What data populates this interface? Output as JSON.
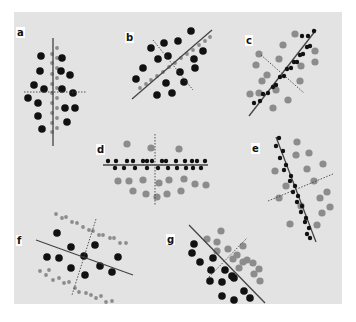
{
  "figure": {
    "background": "#e3e3e3",
    "colors": {
      "dark": "#111111",
      "gray": "#8c8c8c",
      "axis": "#444444"
    },
    "panels": [
      {
        "id": "a",
        "label": "a",
        "label_pos": [
          16,
          27
        ],
        "solid_axis": [
          [
            53,
            38
          ],
          [
            53,
            146
          ]
        ],
        "dashed_axis": [
          [
            24,
            92
          ],
          [
            86,
            92
          ]
        ],
        "dark_large": [
          [
            41,
            56
          ],
          [
            62,
            58
          ],
          [
            40,
            71
          ],
          [
            61,
            71
          ],
          [
            70,
            75
          ],
          [
            34,
            85
          ],
          [
            44,
            89
          ],
          [
            62,
            89
          ],
          [
            73,
            93
          ],
          [
            28,
            98
          ],
          [
            38,
            103
          ],
          [
            65,
            108
          ],
          [
            75,
            108
          ],
          [
            38,
            116
          ],
          [
            67,
            122
          ],
          [
            42,
            129
          ]
        ],
        "gray_small": [
          [
            57,
            48
          ],
          [
            52,
            54
          ],
          [
            57,
            58
          ],
          [
            52,
            63
          ],
          [
            57,
            68
          ],
          [
            52,
            74
          ],
          [
            57,
            78
          ],
          [
            52,
            84
          ],
          [
            57,
            88
          ],
          [
            52,
            93
          ],
          [
            57,
            98
          ],
          [
            52,
            103
          ],
          [
            57,
            108
          ],
          [
            52,
            113
          ],
          [
            57,
            118
          ],
          [
            52,
            123
          ],
          [
            57,
            128
          ],
          [
            52,
            132
          ]
        ]
      },
      {
        "id": "b",
        "label": "b",
        "label_pos": [
          125,
          32
        ],
        "solid_axis": [
          [
            132,
            99
          ],
          [
            212,
            30
          ]
        ],
        "dashed_axis": [
          [
            153,
            40
          ],
          [
            193,
            90
          ]
        ],
        "dark_large": [
          [
            191,
            31
          ],
          [
            151,
            48
          ],
          [
            164,
            43
          ],
          [
            178,
            41
          ],
          [
            203,
            51
          ],
          [
            158,
            59
          ],
          [
            168,
            56
          ],
          [
            194,
            59
          ],
          [
            143,
            68
          ],
          [
            180,
            72
          ],
          [
            195,
            68
          ],
          [
            136,
            79
          ],
          [
            166,
            83
          ],
          [
            184,
            82
          ],
          [
            157,
            95
          ],
          [
            172,
            93
          ]
        ],
        "gray_small": [
          [
            140,
            88
          ],
          [
            146,
            84
          ],
          [
            151,
            80
          ],
          [
            157,
            76
          ],
          [
            163,
            72
          ],
          [
            169,
            67
          ],
          [
            175,
            63
          ],
          [
            181,
            58
          ],
          [
            187,
            54
          ],
          [
            193,
            50
          ],
          [
            199,
            45
          ],
          [
            205,
            41
          ],
          [
            210,
            37
          ]
        ]
      },
      {
        "id": "c",
        "label": "c",
        "label_pos": [
          245,
          35
        ],
        "solid_axis": [
          [
            249,
            116
          ],
          [
            316,
            30
          ]
        ],
        "dashed_axis": [
          [
            261,
            55
          ],
          [
            304,
            93
          ]
        ],
        "dark_large": [],
        "gray_large": [
          [
            295,
            34
          ],
          [
            283,
            45
          ],
          [
            315,
            51
          ],
          [
            315,
            62
          ],
          [
            259,
            54
          ],
          [
            279,
            59
          ],
          [
            301,
            66
          ],
          [
            256,
            65
          ],
          [
            267,
            75
          ],
          [
            262,
            81
          ],
          [
            250,
            94
          ],
          [
            276,
            90
          ],
          [
            300,
            81
          ],
          [
            288,
            100
          ],
          [
            273,
            108
          ],
          [
            259,
            93
          ]
        ],
        "dark_small": [
          [
            254,
            103
          ],
          [
            260,
            101
          ],
          [
            263,
            94
          ],
          [
            268,
            93
          ],
          [
            273,
            87
          ],
          [
            276,
            85
          ],
          [
            280,
            77
          ],
          [
            284,
            76
          ],
          [
            287,
            69
          ],
          [
            291,
            68
          ],
          [
            294,
            62
          ],
          [
            297,
            62
          ],
          [
            300,
            55
          ],
          [
            303,
            54
          ],
          [
            307,
            47
          ],
          [
            310,
            46
          ],
          [
            302,
            36
          ],
          [
            308,
            36
          ],
          [
            314,
            31
          ]
        ]
      },
      {
        "id": "d",
        "label": "d",
        "label_pos": [
          96,
          144
        ],
        "solid_axis": [
          [
            103,
            165
          ],
          [
            208,
            165
          ]
        ],
        "dashed_axis": [
          [
            155,
            134
          ],
          [
            155,
            205
          ]
        ],
        "gray_large": [
          [
            127,
            144
          ],
          [
            151,
            148
          ],
          [
            179,
            149
          ],
          [
            118,
            181
          ],
          [
            129,
            181
          ],
          [
            143,
            180
          ],
          [
            159,
            183
          ],
          [
            169,
            180
          ],
          [
            184,
            179
          ],
          [
            195,
            184
          ],
          [
            133,
            191
          ],
          [
            146,
            194
          ],
          [
            167,
            194
          ],
          [
            181,
            191
          ],
          [
            206,
            185
          ],
          [
            157,
            197
          ]
        ],
        "dark_small": [
          [
            108,
            161
          ],
          [
            116,
            161
          ],
          [
            127,
            161
          ],
          [
            133,
            161
          ],
          [
            143,
            161
          ],
          [
            147,
            161
          ],
          [
            152,
            161
          ],
          [
            162,
            161
          ],
          [
            166,
            161
          ],
          [
            176,
            161
          ],
          [
            185,
            161
          ],
          [
            192,
            161
          ],
          [
            197,
            161
          ],
          [
            205,
            161
          ],
          [
            115,
            168
          ],
          [
            124,
            168
          ],
          [
            135,
            168
          ],
          [
            147,
            168
          ],
          [
            158,
            168
          ],
          [
            168,
            168
          ],
          [
            177,
            168
          ],
          [
            186,
            168
          ],
          [
            193,
            168
          ],
          [
            201,
            168
          ]
        ]
      },
      {
        "id": "e",
        "label": "e",
        "label_pos": [
          251,
          143
        ],
        "solid_axis": [
          [
            276,
            137
          ],
          [
            316,
            242
          ]
        ],
        "dashed_axis": [
          [
            268,
            201
          ],
          [
            333,
            174
          ]
        ],
        "gray_large": [
          [
            297,
            142
          ],
          [
            296,
            155
          ],
          [
            309,
            153
          ],
          [
            275,
            171
          ],
          [
            307,
            169
          ],
          [
            323,
            164
          ],
          [
            286,
            186
          ],
          [
            314,
            181
          ],
          [
            320,
            198
          ],
          [
            327,
            192
          ],
          [
            330,
            207
          ],
          [
            322,
            213
          ],
          [
            317,
            225
          ],
          [
            290,
            224
          ],
          [
            279,
            198
          ],
          [
            301,
            206
          ]
        ],
        "dark_small": [
          [
            279,
            138
          ],
          [
            276,
            146
          ],
          [
            283,
            151
          ],
          [
            280,
            158
          ],
          [
            286,
            165
          ],
          [
            284,
            170
          ],
          [
            291,
            176
          ],
          [
            290,
            181
          ],
          [
            295,
            186
          ],
          [
            293,
            192
          ],
          [
            298,
            196
          ],
          [
            297,
            202
          ],
          [
            302,
            206
          ],
          [
            301,
            212
          ],
          [
            306,
            218
          ],
          [
            305,
            222
          ],
          [
            309,
            228
          ],
          [
            307,
            234
          ],
          [
            310,
            238
          ]
        ]
      },
      {
        "id": "f",
        "label": "f",
        "label_pos": [
          16,
          235
        ],
        "solid_axis": [
          [
            36,
            240
          ],
          [
            133,
            275
          ]
        ],
        "dashed_axis": [
          [
            96,
            219
          ],
          [
            72,
            295
          ]
        ],
        "dark_large": [
          [
            57,
            233
          ],
          [
            71,
            247
          ],
          [
            95,
            245
          ],
          [
            47,
            257
          ],
          [
            59,
            258
          ],
          [
            84,
            256
          ],
          [
            118,
            257
          ],
          [
            71,
            268
          ],
          [
            100,
            266
          ],
          [
            85,
            275
          ],
          [
            112,
            272
          ]
        ],
        "gray_small": [
          [
            56,
            214
          ],
          [
            62,
            218
          ],
          [
            66,
            217
          ],
          [
            72,
            222
          ],
          [
            77,
            223
          ],
          [
            83,
            227
          ],
          [
            89,
            230
          ],
          [
            93,
            231
          ],
          [
            99,
            235
          ],
          [
            103,
            235
          ],
          [
            110,
            238
          ],
          [
            114,
            238
          ],
          [
            120,
            243
          ],
          [
            126,
            243
          ],
          [
            40,
            271
          ],
          [
            46,
            275
          ],
          [
            49,
            270
          ],
          [
            53,
            280
          ],
          [
            59,
            278
          ],
          [
            64,
            283
          ],
          [
            69,
            282
          ],
          [
            75,
            288
          ],
          [
            79,
            292
          ],
          [
            86,
            293
          ],
          [
            91,
            295
          ],
          [
            96,
            298
          ],
          [
            101,
            296
          ],
          [
            106,
            302
          ],
          [
            112,
            301
          ]
        ]
      },
      {
        "id": "g",
        "label": "g",
        "label_pos": [
          166,
          234
        ],
        "solid_axis": [
          [
            189,
            225
          ],
          [
            265,
            303
          ]
        ],
        "dashed_axis": [
          [
            209,
            277
          ],
          [
            247,
            238
          ]
        ],
        "dark_large": [
          [
            194,
            244
          ],
          [
            192,
            253
          ],
          [
            200,
            262
          ],
          [
            213,
            258
          ],
          [
            211,
            270
          ],
          [
            225,
            270
          ],
          [
            210,
            281
          ],
          [
            222,
            282
          ],
          [
            234,
            278
          ],
          [
            244,
            291
          ],
          [
            222,
            296
          ],
          [
            234,
            300
          ],
          [
            250,
            298
          ],
          [
            232,
            276
          ]
        ],
        "gray_large": [
          [
            221,
            231
          ],
          [
            207,
            239
          ],
          [
            217,
            242
          ],
          [
            228,
            249
          ],
          [
            217,
            251
          ],
          [
            237,
            255
          ],
          [
            243,
            262
          ],
          [
            247,
            260
          ],
          [
            239,
            268
          ],
          [
            253,
            263
          ],
          [
            259,
            269
          ],
          [
            254,
            274
          ],
          [
            260,
            281
          ],
          [
            243,
            246
          ],
          [
            233,
            259
          ]
        ]
      }
    ]
  }
}
